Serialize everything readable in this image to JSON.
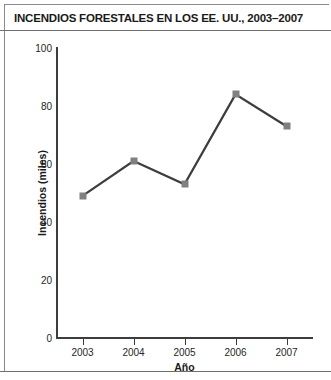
{
  "chart_data": {
    "type": "line",
    "title": "INCENDIOS FORESTALES EN LOS EE. UU., 2003–2007",
    "xlabel": "Año",
    "ylabel": "Incendios (miles)",
    "categories": [
      "2003",
      "2004",
      "2005",
      "2006",
      "2007"
    ],
    "x": [
      2003,
      2004,
      2005,
      2006,
      2007
    ],
    "values": [
      49,
      61,
      53,
      84,
      73
    ],
    "series": [
      {
        "name": "Incendios forestales",
        "values": [
          49,
          61,
          53,
          84,
          73
        ]
      }
    ],
    "ylim": [
      0,
      100
    ],
    "yticks": [
      "0",
      "20",
      "40",
      "60",
      "80",
      "100"
    ],
    "ytick_values": [
      0,
      20,
      40,
      60,
      80,
      100
    ],
    "grid": false,
    "legend": "none",
    "marker": "square",
    "marker_color": "#808080",
    "line_color": "#3d3d3d",
    "axis_color": "#3d3d3d",
    "background_color": "#ffffff"
  }
}
